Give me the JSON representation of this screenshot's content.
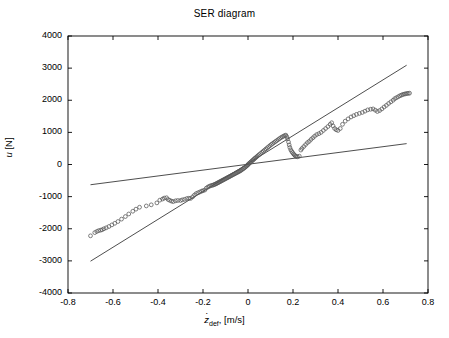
{
  "figure": {
    "title": "SER diagram",
    "background": "#ffffff",
    "axis_color": "#000000",
    "marker_color": "#555555",
    "line_color": "#3a3a3a"
  },
  "axes": {
    "x_label_main": "z",
    "x_label_sub": "def",
    "x_label_unit": ", [m/s]",
    "x_label_full": "ż_def, [m/s]",
    "y_label_main": "u",
    "y_label_unit": " [N]",
    "y_label_full": "u [N]",
    "x_ticks": [
      "-0.8",
      "-0.6",
      "-0.4",
      "-0.2",
      "0",
      "0.2",
      "0.4",
      "0.6",
      "0.8"
    ],
    "y_ticks": [
      "4000",
      "3000",
      "2000",
      "1000",
      "0",
      "-1000",
      "-2000",
      "-3000",
      "-4000"
    ],
    "x_min": -0.8,
    "x_max": 0.8,
    "y_min": -4000,
    "y_max": 4000
  },
  "chart_data": {
    "type": "scatter",
    "title": "SER diagram",
    "xlabel": "ż_def, [m/s]",
    "ylabel": "u [N]",
    "xlim": [
      -0.8,
      0.8
    ],
    "ylim": [
      -4000,
      4000
    ],
    "xticks": [
      -0.8,
      -0.6,
      -0.4,
      -0.2,
      0,
      0.2,
      0.4,
      0.6,
      0.8
    ],
    "yticks": [
      -4000,
      -3000,
      -2000,
      -1000,
      0,
      1000,
      2000,
      3000,
      4000
    ],
    "grid": false,
    "legend": "none",
    "series": [
      {
        "name": "measured force vs deflection velocity",
        "type": "scatter",
        "marker": "o",
        "marker_filled": false,
        "points": [
          [
            -0.7,
            -2220
          ],
          [
            -0.681,
            -2120
          ],
          [
            -0.672,
            -2085
          ],
          [
            -0.664,
            -2060
          ],
          [
            -0.655,
            -2045
          ],
          [
            -0.648,
            -2030
          ],
          [
            -0.64,
            -2000
          ],
          [
            -0.63,
            -1970
          ],
          [
            -0.618,
            -1930
          ],
          [
            -0.605,
            -1880
          ],
          [
            -0.592,
            -1830
          ],
          [
            -0.578,
            -1775
          ],
          [
            -0.562,
            -1700
          ],
          [
            -0.545,
            -1620
          ],
          [
            -0.53,
            -1540
          ],
          [
            -0.512,
            -1455
          ],
          [
            -0.498,
            -1390
          ],
          [
            -0.482,
            -1330
          ],
          [
            -0.452,
            -1290
          ],
          [
            -0.43,
            -1255
          ],
          [
            -0.405,
            -1195
          ],
          [
            -0.392,
            -1110
          ],
          [
            -0.38,
            -1075
          ],
          [
            -0.372,
            -1045
          ],
          [
            -0.362,
            -1035
          ],
          [
            -0.355,
            -1090
          ],
          [
            -0.348,
            -1115
          ],
          [
            -0.34,
            -1140
          ],
          [
            -0.332,
            -1155
          ],
          [
            -0.322,
            -1130
          ],
          [
            -0.312,
            -1120
          ],
          [
            -0.3,
            -1120
          ],
          [
            -0.292,
            -1100
          ],
          [
            -0.282,
            -1085
          ],
          [
            -0.272,
            -1060
          ],
          [
            -0.263,
            -1050
          ],
          [
            -0.255,
            -1055
          ],
          [
            -0.246,
            -1005
          ],
          [
            -0.238,
            -950
          ],
          [
            -0.23,
            -905
          ],
          [
            -0.222,
            -880
          ],
          [
            -0.214,
            -855
          ],
          [
            -0.206,
            -830
          ],
          [
            -0.2,
            -815
          ],
          [
            -0.192,
            -795
          ],
          [
            -0.185,
            -735
          ],
          [
            -0.178,
            -700
          ],
          [
            -0.172,
            -680
          ],
          [
            -0.166,
            -660
          ],
          [
            -0.16,
            -650
          ],
          [
            -0.155,
            -640
          ],
          [
            -0.15,
            -625
          ],
          [
            -0.146,
            -615
          ],
          [
            -0.142,
            -600
          ],
          [
            -0.138,
            -585
          ],
          [
            -0.134,
            -570
          ],
          [
            -0.13,
            -555
          ],
          [
            -0.126,
            -540
          ],
          [
            -0.122,
            -525
          ],
          [
            -0.118,
            -510
          ],
          [
            -0.114,
            -495
          ],
          [
            -0.11,
            -480
          ],
          [
            -0.106,
            -465
          ],
          [
            -0.102,
            -450
          ],
          [
            -0.098,
            -435
          ],
          [
            -0.094,
            -420
          ],
          [
            -0.09,
            -405
          ],
          [
            -0.086,
            -390
          ],
          [
            -0.082,
            -375
          ],
          [
            -0.078,
            -360
          ],
          [
            -0.074,
            -345
          ],
          [
            -0.07,
            -330
          ],
          [
            -0.066,
            -315
          ],
          [
            -0.062,
            -300
          ],
          [
            -0.058,
            -285
          ],
          [
            -0.054,
            -270
          ],
          [
            -0.05,
            -255
          ],
          [
            -0.046,
            -240
          ],
          [
            -0.042,
            -225
          ],
          [
            -0.038,
            -210
          ],
          [
            -0.034,
            -195
          ],
          [
            -0.03,
            -175
          ],
          [
            -0.026,
            -155
          ],
          [
            -0.022,
            -135
          ],
          [
            -0.018,
            -115
          ],
          [
            -0.014,
            -95
          ],
          [
            -0.01,
            -70
          ],
          [
            -0.006,
            -45
          ],
          [
            -0.003,
            -25
          ],
          [
            0.0,
            -5
          ],
          [
            0.003,
            18
          ],
          [
            0.007,
            45
          ],
          [
            0.011,
            70
          ],
          [
            0.015,
            95
          ],
          [
            0.019,
            120
          ],
          [
            0.023,
            145
          ],
          [
            0.027,
            170
          ],
          [
            0.031,
            195
          ],
          [
            0.035,
            220
          ],
          [
            0.04,
            250
          ],
          [
            0.045,
            280
          ],
          [
            0.05,
            310
          ],
          [
            0.056,
            345
          ],
          [
            0.062,
            380
          ],
          [
            0.068,
            415
          ],
          [
            0.074,
            450
          ],
          [
            0.08,
            485
          ],
          [
            0.086,
            520
          ],
          [
            0.092,
            555
          ],
          [
            0.098,
            590
          ],
          [
            0.104,
            625
          ],
          [
            0.11,
            655
          ],
          [
            0.116,
            685
          ],
          [
            0.122,
            715
          ],
          [
            0.128,
            745
          ],
          [
            0.134,
            775
          ],
          [
            0.14,
            805
          ],
          [
            0.146,
            835
          ],
          [
            0.152,
            860
          ],
          [
            0.158,
            880
          ],
          [
            0.163,
            900
          ],
          [
            0.168,
            915
          ],
          [
            0.172,
            870
          ],
          [
            0.176,
            800
          ],
          [
            0.18,
            700
          ],
          [
            0.183,
            610
          ],
          [
            0.186,
            530
          ],
          [
            0.19,
            460
          ],
          [
            0.194,
            410
          ],
          [
            0.198,
            370
          ],
          [
            0.202,
            330
          ],
          [
            0.206,
            300
          ],
          [
            0.21,
            270
          ],
          [
            0.215,
            250
          ],
          [
            0.22,
            240
          ],
          [
            0.228,
            260
          ],
          [
            0.235,
            450
          ],
          [
            0.24,
            500
          ],
          [
            0.248,
            560
          ],
          [
            0.256,
            620
          ],
          [
            0.264,
            680
          ],
          [
            0.272,
            720
          ],
          [
            0.28,
            780
          ],
          [
            0.288,
            830
          ],
          [
            0.296,
            880
          ],
          [
            0.305,
            930
          ],
          [
            0.315,
            960
          ],
          [
            0.325,
            1000
          ],
          [
            0.335,
            1060
          ],
          [
            0.345,
            1120
          ],
          [
            0.355,
            1180
          ],
          [
            0.365,
            1250
          ],
          [
            0.372,
            1300
          ],
          [
            0.378,
            1200
          ],
          [
            0.385,
            1120
          ],
          [
            0.392,
            1080
          ],
          [
            0.4,
            1060
          ],
          [
            0.41,
            1120
          ],
          [
            0.42,
            1250
          ],
          [
            0.432,
            1350
          ],
          [
            0.445,
            1420
          ],
          [
            0.458,
            1480
          ],
          [
            0.47,
            1520
          ],
          [
            0.482,
            1560
          ],
          [
            0.495,
            1590
          ],
          [
            0.508,
            1620
          ],
          [
            0.52,
            1660
          ],
          [
            0.532,
            1700
          ],
          [
            0.545,
            1720
          ],
          [
            0.556,
            1730
          ],
          [
            0.566,
            1690
          ],
          [
            0.575,
            1650
          ],
          [
            0.585,
            1680
          ],
          [
            0.595,
            1730
          ],
          [
            0.605,
            1790
          ],
          [
            0.615,
            1840
          ],
          [
            0.625,
            1900
          ],
          [
            0.635,
            1950
          ],
          [
            0.645,
            2000
          ],
          [
            0.652,
            2050
          ],
          [
            0.66,
            2080
          ],
          [
            0.668,
            2110
          ],
          [
            0.675,
            2140
          ],
          [
            0.682,
            2160
          ],
          [
            0.688,
            2180
          ],
          [
            0.694,
            2190
          ],
          [
            0.7,
            2200
          ],
          [
            0.706,
            2210
          ],
          [
            0.712,
            2215
          ],
          [
            0.718,
            2220
          ]
        ]
      },
      {
        "name": "upper bound damping line",
        "type": "line",
        "slope": 4400,
        "intercept": 0,
        "x_from": -0.7,
        "x_to": 0.705,
        "y_from": -3010,
        "y_to": 3090
      },
      {
        "name": "lower bound damping line",
        "type": "line",
        "slope": 900,
        "intercept": 0,
        "x_from": -0.7,
        "x_to": 0.705,
        "y_from": -630,
        "y_to": 650
      }
    ]
  }
}
